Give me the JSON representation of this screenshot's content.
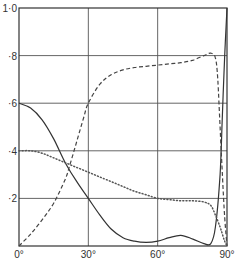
{
  "chart_data": {
    "type": "line",
    "title": "",
    "xlabel": "",
    "ylabel": "",
    "xlim": [
      0,
      90
    ],
    "ylim": [
      0,
      1.0
    ],
    "grid": true,
    "legend": "none",
    "x_ticks": [
      {
        "value": 0,
        "label": "0°"
      },
      {
        "value": 30,
        "label": "30°"
      },
      {
        "value": 60,
        "label": "60°"
      },
      {
        "value": 90,
        "label": "90°"
      }
    ],
    "y_ticks": [
      {
        "value": 0.2,
        "label": "·2"
      },
      {
        "value": 0.4,
        "label": "·4"
      },
      {
        "value": 0.6,
        "label": "·6"
      },
      {
        "value": 0.8,
        "label": "·8"
      },
      {
        "value": 1.0,
        "label": "1·0"
      }
    ],
    "series": [
      {
        "name": "solid",
        "style": "solid",
        "color": "#333333",
        "x": [
          0,
          5,
          10,
          15,
          20,
          25,
          30,
          35,
          40,
          45,
          50,
          55,
          60,
          65,
          70,
          75,
          80,
          83,
          85,
          87,
          88,
          89,
          90
        ],
        "values": [
          0.6,
          0.58,
          0.53,
          0.45,
          0.35,
          0.27,
          0.2,
          0.13,
          0.07,
          0.035,
          0.02,
          0.015,
          0.02,
          0.035,
          0.045,
          0.03,
          0.01,
          0.01,
          0.08,
          0.3,
          0.55,
          0.8,
          1.0
        ]
      },
      {
        "name": "dashed",
        "style": "dashed",
        "color": "#444444",
        "x": [
          0,
          5,
          10,
          15,
          20,
          22,
          25,
          28,
          30,
          35,
          40,
          45,
          50,
          55,
          60,
          65,
          70,
          75,
          80,
          83,
          85,
          86,
          87,
          88,
          89,
          90
        ],
        "values": [
          0.0,
          0.05,
          0.11,
          0.18,
          0.28,
          0.34,
          0.44,
          0.54,
          0.6,
          0.68,
          0.72,
          0.74,
          0.75,
          0.755,
          0.76,
          0.765,
          0.77,
          0.78,
          0.8,
          0.81,
          0.79,
          0.7,
          0.5,
          0.3,
          0.12,
          0.0
        ]
      },
      {
        "name": "dotted",
        "style": "dotted",
        "color": "#555555",
        "x": [
          0,
          5,
          10,
          15,
          20,
          25,
          30,
          35,
          40,
          45,
          50,
          55,
          60,
          65,
          70,
          75,
          80,
          83,
          85,
          87,
          88,
          89,
          90
        ],
        "values": [
          0.4,
          0.4,
          0.39,
          0.37,
          0.35,
          0.33,
          0.31,
          0.29,
          0.27,
          0.25,
          0.23,
          0.215,
          0.2,
          0.195,
          0.19,
          0.19,
          0.185,
          0.17,
          0.13,
          0.08,
          0.05,
          0.02,
          0.0
        ]
      }
    ]
  }
}
